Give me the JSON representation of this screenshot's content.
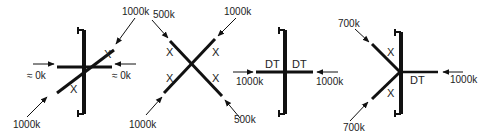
{
  "diagrams": [
    {
      "id": "panel-1",
      "inputs": {
        "top_right": "1000k",
        "bottom_left": "1000k",
        "left": "≈ 0k",
        "right": "≈ 0k"
      },
      "segment_labels": [
        "X",
        "X"
      ]
    },
    {
      "id": "panel-2",
      "inputs": {
        "top_left": "500k",
        "top_right": "1000k",
        "bottom_left": "1000k",
        "bottom_right": "500k"
      },
      "segment_labels": [
        "X",
        "X",
        "X",
        "X"
      ]
    },
    {
      "id": "panel-3",
      "inputs": {
        "left": "1000k",
        "right": "1000k"
      },
      "segment_labels": [
        "DT",
        "DT"
      ]
    },
    {
      "id": "panel-4",
      "inputs": {
        "top_left": "700k",
        "bottom_left": "700k",
        "right": "1000k"
      },
      "segment_labels": [
        "X",
        "X",
        "DT"
      ]
    }
  ],
  "colors": {
    "ink": "#111111",
    "background": "#ffffff"
  }
}
